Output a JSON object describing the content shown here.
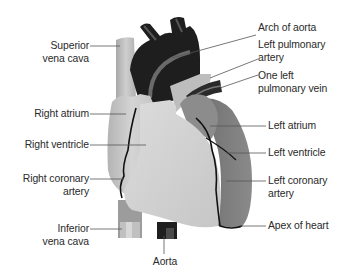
{
  "colors": {
    "background": "#ffffff",
    "right_side_light": "#c9c9c9",
    "right_ventricle": "#d2d2d2",
    "left_side": "#7a7a7a",
    "aorta_dark": "#1e1e1e",
    "pulmonary_band": "#6a6a6a",
    "vena_cava": "#b8b8b8",
    "coronary_vessel": "#111111",
    "leader_line": "#555555",
    "label_text": "#2a2a2a"
  },
  "labels": {
    "superior_vena_cava": [
      "Superior",
      "vena cava"
    ],
    "right_atrium": [
      "Right atrium"
    ],
    "right_ventricle": [
      "Right ventricle"
    ],
    "right_coronary_artery": [
      "Right coronary",
      "artery"
    ],
    "inferior_vena_cava": [
      "Inferior",
      "vena cava"
    ],
    "aorta": [
      "Aorta"
    ],
    "arch_of_aorta": [
      "Arch of aorta"
    ],
    "left_pulmonary_artery": [
      "Left pulmonary",
      "artery"
    ],
    "one_left_pulmonary_vein": [
      "One left",
      "pulmonary vein"
    ],
    "left_atrium": [
      "Left atrium"
    ],
    "left_ventricle": [
      "Left ventricle"
    ],
    "left_coronary_artery": [
      "Left coronary",
      "artery"
    ],
    "apex_of_heart": [
      "Apex of heart"
    ]
  }
}
